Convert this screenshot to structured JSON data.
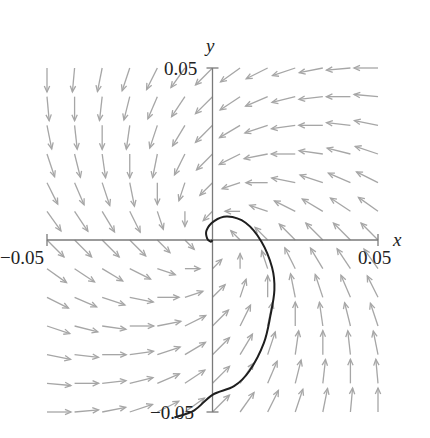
{
  "chart_data": {
    "type": "vector-field",
    "title": "",
    "xlabel": "x",
    "ylabel": "y",
    "xlim": [
      -0.05,
      0.05
    ],
    "ylim": [
      -0.05,
      0.05
    ],
    "grid": false,
    "x_ticks": [
      {
        "value": -0.05,
        "label": "−0.05"
      },
      {
        "value": 0.05,
        "label": "0.05"
      }
    ],
    "y_ticks": [
      {
        "value": 0.05,
        "label": "0.05"
      },
      {
        "value": -0.05,
        "label": "−0.05"
      }
    ],
    "field": {
      "description": "direction field of linear system dx/dt = a*x - b*y, dy/dt = b*x + a*y (stable spiral)",
      "a": -1,
      "b": 1,
      "grid_n": 13,
      "grid_range": [
        -0.05,
        0.05
      ],
      "arrow_color": "#a6a6a6"
    },
    "trajectory": {
      "color": "#1e1e1e",
      "points": [
        [
          -0.0115,
          -0.0516
        ],
        [
          -0.0055,
          -0.0495
        ],
        [
          0.0,
          -0.045
        ],
        [
          0.0065,
          -0.0425
        ],
        [
          0.0112,
          -0.038
        ],
        [
          0.0155,
          -0.03
        ],
        [
          0.0175,
          -0.022
        ],
        [
          0.0187,
          -0.0145
        ],
        [
          0.018,
          -0.008
        ],
        [
          0.0148,
          -0.0005
        ],
        [
          0.01,
          0.005
        ],
        [
          0.0045,
          0.0068
        ],
        [
          0.0005,
          0.0055
        ],
        [
          -0.0018,
          0.0028
        ],
        [
          -0.0016,
          0.0004
        ],
        [
          -0.0005,
          -0.0005
        ],
        [
          0.0,
          0.0
        ]
      ]
    }
  }
}
